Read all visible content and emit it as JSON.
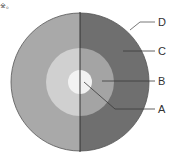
{
  "corner_mark": "※。",
  "diagram": {
    "labels": [
      {
        "id": "D",
        "text": "D"
      },
      {
        "id": "C",
        "text": "C"
      },
      {
        "id": "B",
        "text": "B"
      },
      {
        "id": "A",
        "text": "A"
      }
    ],
    "colors": {
      "outer_left": "#a9a9a9",
      "outer_right": "#6f6f6f",
      "middle_left": "#d0d0d0",
      "middle_right": "#a4a4a4",
      "inner": "#f2f2f2",
      "divider": "#333333",
      "leader": "#3a3a3a"
    }
  }
}
